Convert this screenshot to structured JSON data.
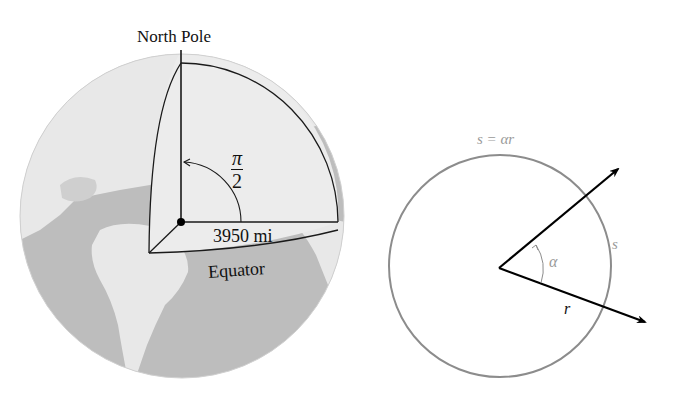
{
  "left_figure": {
    "north_pole_label": "North Pole",
    "angle_label_numerator": "π",
    "angle_label_denominator": "2",
    "radius_label": "3950 mi",
    "equator_label": "Equator",
    "colors": {
      "ocean": "#b8b8b8",
      "land": "#e6e6e6",
      "lines": "#1a1a1a"
    }
  },
  "right_figure": {
    "arc_formula_label": "s = αr",
    "arc_label": "s",
    "angle_label": "α",
    "radius_label": "r",
    "colors": {
      "circle": "#8c8c8c",
      "arrows": "#000000",
      "labels": "#9a9a9a"
    }
  }
}
